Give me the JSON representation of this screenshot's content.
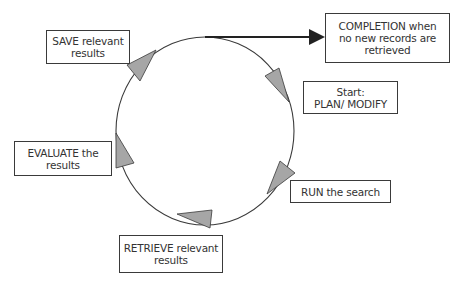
{
  "diagram": {
    "nodes": {
      "save": {
        "lines": [
          "SAVE relevant",
          "results"
        ]
      },
      "completion": {
        "lines": [
          "COMPLETION when",
          "no new records are",
          "retrieved"
        ]
      },
      "start": {
        "lines": [
          "Start:",
          "PLAN/ MODIFY"
        ]
      },
      "run": {
        "lines": [
          "RUN the search"
        ]
      },
      "retrieve": {
        "lines": [
          "RETRIEVE relevant",
          "results"
        ]
      },
      "evaluate": {
        "lines": [
          "EVALUATE the",
          "results"
        ]
      }
    },
    "cycle_order": [
      "start",
      "run",
      "retrieve",
      "evaluate",
      "save"
    ],
    "exit_edge": {
      "from": "cycle",
      "to": "completion"
    },
    "colors": {
      "line": "#3a3a3a",
      "arrow_fill": "#a6a6a6",
      "exit_arrow": "#222222",
      "text": "#333333",
      "box_border": "#3a3a3a"
    }
  }
}
